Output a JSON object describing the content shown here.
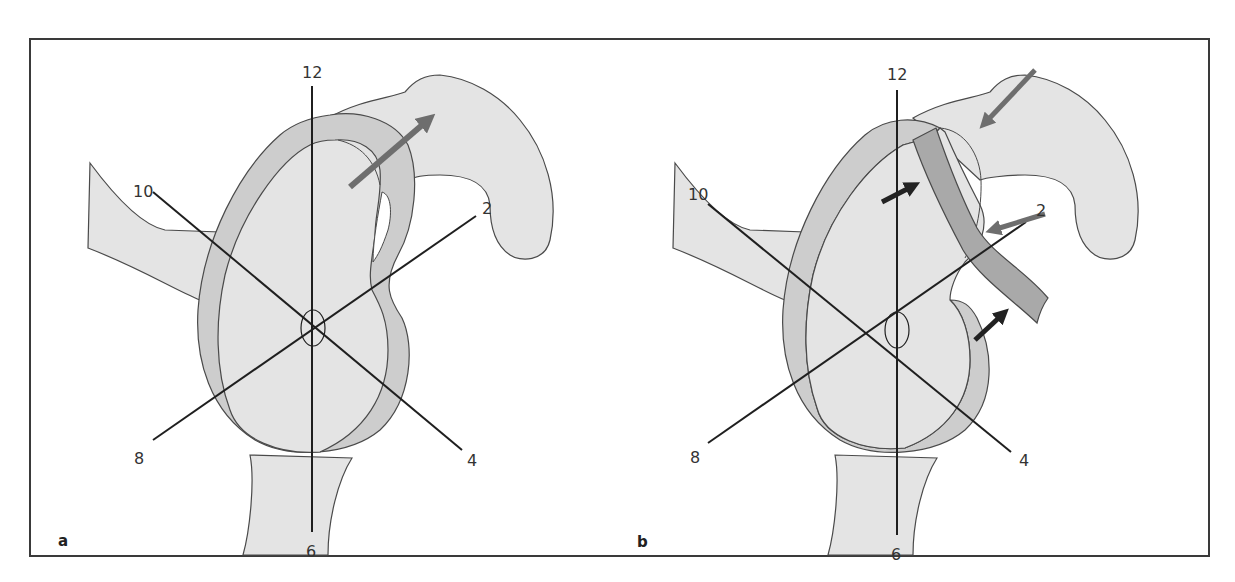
{
  "figure": {
    "frame": {
      "x": 30,
      "y": 38,
      "width": 1179,
      "height": 518
    },
    "colors": {
      "frame": "#3a3a3a",
      "bone": "#e4e4e4",
      "outline": "#4a4a4a",
      "labrum": "#cdcdcd",
      "labrum_shadow": "#bdbdbd",
      "torn_labrum": "#a9a9a9",
      "clock_line": "#1f1f1f",
      "gray_arrow": "#6e6e6e",
      "black_arrow": "#222222"
    },
    "panels": [
      {
        "id": "a",
        "label": "a",
        "clock_labels": {
          "12": "12",
          "2": "2",
          "4": "4",
          "6": "6",
          "8": "8",
          "10": "10"
        },
        "arrows": [
          {
            "type": "gray",
            "direction": "outward-superior-anterior"
          }
        ]
      },
      {
        "id": "b",
        "label": "b",
        "clock_labels": {
          "12": "12",
          "2": "2",
          "4": "4",
          "6": "6",
          "8": "8",
          "10": "10"
        },
        "arrows": [
          {
            "type": "gray",
            "direction": "inward-from-superior"
          },
          {
            "type": "gray",
            "direction": "inward-from-2-oclock"
          },
          {
            "type": "black",
            "direction": "pointing-to-labrum-inner"
          },
          {
            "type": "black",
            "direction": "pointing-to-labrum-tip"
          }
        ]
      }
    ]
  }
}
